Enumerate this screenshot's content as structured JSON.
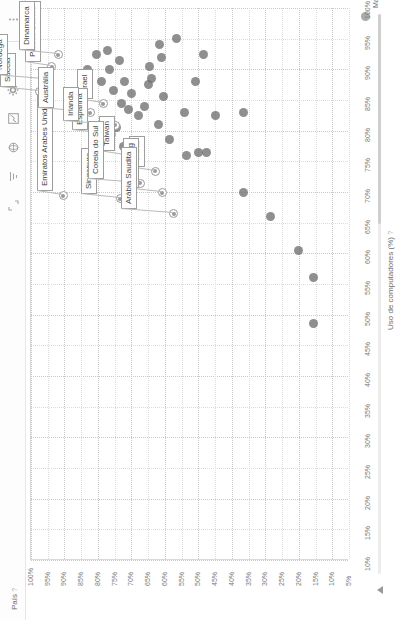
{
  "app": {
    "toolbar": {
      "items": [
        {
          "name": "more-options-icon",
          "glyph": "⋮"
        },
        {
          "name": "cursor-icon",
          "glyph": "↖"
        },
        {
          "name": "gear-icon",
          "glyph": "✱"
        },
        {
          "name": "chart-icon",
          "glyph": "▨"
        },
        {
          "name": "globe-icon",
          "glyph": "◉"
        },
        {
          "name": "filter-icon",
          "glyph": "≡"
        },
        {
          "name": "expand-icon",
          "glyph": "⌐"
        }
      ]
    }
  },
  "legend": {
    "series_label": "Mar 2015",
    "dot_color": "#9b9b9b"
  },
  "chart_data": {
    "type": "scatter",
    "title": "",
    "xlabel": "Uso de computadores (%)",
    "ylabel": "País",
    "xlabel_help": "?",
    "ylabel_help": "?",
    "series_name": "Mar 2015",
    "grid": true,
    "legend_position": "top-right",
    "xlim": [
      10,
      100
    ],
    "ylim": [
      5,
      100
    ],
    "xticks": [
      "10%",
      "15%",
      "20%",
      "25%",
      "30%",
      "35%",
      "40%",
      "45%",
      "50%",
      "55%",
      "60%",
      "65%",
      "70%",
      "75%",
      "80%",
      "85%",
      "90%",
      "95%",
      "100%"
    ],
    "yticks": [
      "5%",
      "10%",
      "15%",
      "20%",
      "25%",
      "30%",
      "35%",
      "40%",
      "45%",
      "50%",
      "55%",
      "60%",
      "65%",
      "70%",
      "75%",
      "80%",
      "85%",
      "90%",
      "95%",
      "100%"
    ],
    "point_color": "#6f6f6f",
    "labeled_points": [
      {
        "label": "Emiratos Arabes Unidos",
        "x": 69.5,
        "y": 90.5
      },
      {
        "label": "Suécia",
        "x": 86.5,
        "y": 97.5
      },
      {
        "label": "Noruega",
        "x": 88.5,
        "y": 96.0
      },
      {
        "label": "Países Baixos",
        "x": 90.5,
        "y": 94.0
      },
      {
        "label": "Dinamarca",
        "x": 92.5,
        "y": 92.0
      },
      {
        "label": "Austrália",
        "x": 83.0,
        "y": 82.5
      },
      {
        "label": "Israel",
        "x": 84.5,
        "y": 78.5
      },
      {
        "label": "Espanha",
        "x": 79.5,
        "y": 76.0
      },
      {
        "label": "Irlanda",
        "x": 81.0,
        "y": 75.0
      },
      {
        "label": "Taiwan",
        "x": 76.0,
        "y": 72.0
      },
      {
        "label": "Singapura",
        "x": 69.0,
        "y": 73.5
      },
      {
        "label": "Coreia do Sul",
        "x": 71.5,
        "y": 67.5
      },
      {
        "label": "China",
        "x": 73.5,
        "y": 63.0
      },
      {
        "label": "Hong Kong",
        "x": 70.0,
        "y": 61.0
      },
      {
        "label": "Arábia Saudita",
        "x": 66.5,
        "y": 57.5
      }
    ],
    "unlabeled_points": [
      {
        "x": 86.0,
        "y": 87.5
      },
      {
        "x": 90.0,
        "y": 83.0
      },
      {
        "x": 88.0,
        "y": 79.0
      },
      {
        "x": 92.5,
        "y": 80.5
      },
      {
        "x": 86.5,
        "y": 75.5
      },
      {
        "x": 90.0,
        "y": 76.5
      },
      {
        "x": 93.0,
        "y": 77.0
      },
      {
        "x": 84.5,
        "y": 73.0
      },
      {
        "x": 88.0,
        "y": 72.0
      },
      {
        "x": 91.5,
        "y": 73.5
      },
      {
        "x": 79.0,
        "y": 78.5
      },
      {
        "x": 81.5,
        "y": 77.0
      },
      {
        "x": 80.5,
        "y": 74.5
      },
      {
        "x": 83.5,
        "y": 71.0
      },
      {
        "x": 86.0,
        "y": 70.0
      },
      {
        "x": 82.5,
        "y": 68.0
      },
      {
        "x": 77.5,
        "y": 72.5
      },
      {
        "x": 78.0,
        "y": 69.5
      },
      {
        "x": 84.0,
        "y": 66.0
      },
      {
        "x": 87.5,
        "y": 65.0
      },
      {
        "x": 88.5,
        "y": 64.0
      },
      {
        "x": 90.5,
        "y": 64.5
      },
      {
        "x": 81.0,
        "y": 62.0
      },
      {
        "x": 85.5,
        "y": 60.5
      },
      {
        "x": 92.0,
        "y": 61.0
      },
      {
        "x": 94.0,
        "y": 61.5
      },
      {
        "x": 78.5,
        "y": 58.5
      },
      {
        "x": 83.0,
        "y": 54.0
      },
      {
        "x": 88.0,
        "y": 51.0
      },
      {
        "x": 92.5,
        "y": 48.5
      },
      {
        "x": 76.0,
        "y": 53.5
      },
      {
        "x": 76.5,
        "y": 50.0
      },
      {
        "x": 76.5,
        "y": 47.5
      },
      {
        "x": 82.5,
        "y": 45.0
      },
      {
        "x": 70.0,
        "y": 36.5
      },
      {
        "x": 83.0,
        "y": 36.5
      },
      {
        "x": 95.0,
        "y": 56.5
      },
      {
        "x": 66.0,
        "y": 28.5
      },
      {
        "x": 60.5,
        "y": 20.0
      },
      {
        "x": 56.0,
        "y": 15.5
      },
      {
        "x": 48.5,
        "y": 15.5
      }
    ]
  }
}
